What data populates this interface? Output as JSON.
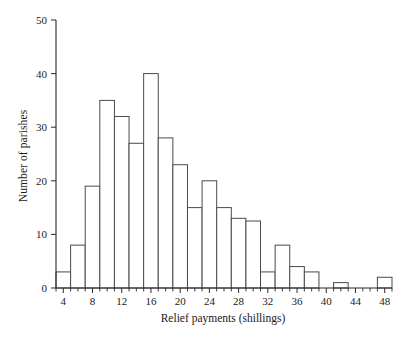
{
  "chart_data": {
    "type": "bar",
    "title": "",
    "xlabel": "Relief payments (shillings)",
    "ylabel": "Number of parishes",
    "xlim": [
      3,
      49
    ],
    "ylim": [
      0,
      50
    ],
    "grid": false,
    "legend": "none",
    "bin_width": 2,
    "x_tick_labels": [
      "4",
      "8",
      "12",
      "16",
      "20",
      "24",
      "28",
      "32",
      "36",
      "40",
      "44",
      "48"
    ],
    "x_tick_values": [
      4,
      8,
      12,
      16,
      20,
      24,
      28,
      32,
      36,
      40,
      44,
      48
    ],
    "x_minor_ticks": [
      3,
      5,
      6,
      7,
      9,
      10,
      11,
      13,
      14,
      15,
      17,
      18,
      19,
      21,
      22,
      23,
      25,
      26,
      27,
      29,
      30,
      31,
      33,
      34,
      35,
      37,
      38,
      39,
      41,
      42,
      43,
      45,
      46,
      47,
      49
    ],
    "y_tick_labels": [
      "0",
      "10",
      "20",
      "30",
      "40",
      "50"
    ],
    "y_tick_values": [
      0,
      10,
      20,
      30,
      40,
      50
    ],
    "categories": [
      "3-5",
      "5-7",
      "7-9",
      "9-11",
      "11-13",
      "13-15",
      "15-17",
      "17-19",
      "19-21",
      "21-23",
      "23-25",
      "25-27",
      "27-29",
      "29-31",
      "31-33",
      "33-35",
      "35-37",
      "37-39",
      "39-41",
      "41-43",
      "43-45",
      "45-47",
      "47-49"
    ],
    "bin_starts": [
      3,
      5,
      7,
      9,
      11,
      13,
      15,
      17,
      19,
      21,
      23,
      25,
      27,
      29,
      31,
      33,
      35,
      37,
      39,
      41,
      43,
      45,
      47
    ],
    "values": [
      3,
      8,
      19,
      35,
      32,
      27,
      40,
      28,
      23,
      15,
      20,
      15,
      13,
      12.5,
      3,
      8,
      4,
      3,
      0,
      1,
      0,
      0,
      2
    ],
    "series": [
      {
        "name": "Number of parishes",
        "values": [
          3,
          8,
          19,
          35,
          32,
          27,
          40,
          28,
          23,
          15,
          20,
          15,
          13,
          12.5,
          3,
          8,
          4,
          3,
          0,
          1,
          0,
          0,
          2
        ]
      }
    ],
    "colors": {
      "bar_fill": "#ffffff",
      "bar_stroke": "#4a4a4a",
      "axis": "#2b2b2b",
      "text": "#1a1a1a",
      "background": "#ffffff"
    }
  }
}
